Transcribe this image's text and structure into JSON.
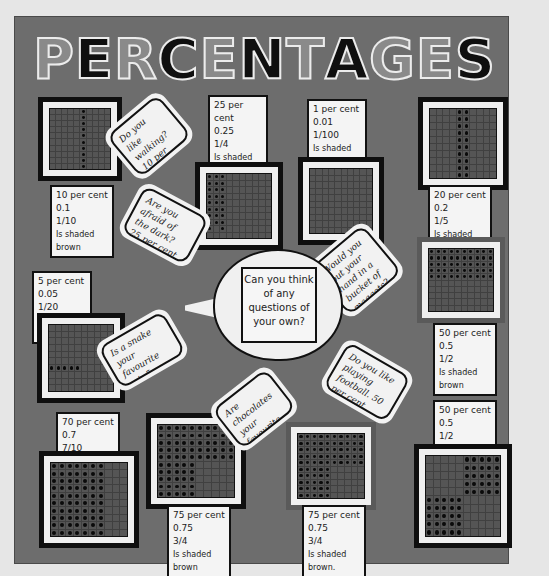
{
  "display": {
    "type": "classroom wall display board",
    "colors": {
      "background": "#e6e6e6",
      "board": "#6d6d6d",
      "letter_gray": "#8a8a8a",
      "letter_black": "#0f0f0f",
      "card": "#f4f4f4",
      "border": "#111111"
    },
    "title": {
      "text": "PERCENTAGES",
      "letters": [
        {
          "char": "P",
          "tone": "gray"
        },
        {
          "char": "E",
          "tone": "black"
        },
        {
          "char": "R",
          "tone": "gray"
        },
        {
          "char": "C",
          "tone": "black"
        },
        {
          "char": "E",
          "tone": "gray"
        },
        {
          "char": "N",
          "tone": "black"
        },
        {
          "char": "T",
          "tone": "gray"
        },
        {
          "char": "A",
          "tone": "black"
        },
        {
          "char": "G",
          "tone": "gray"
        },
        {
          "char": "E",
          "tone": "gray"
        },
        {
          "char": "S",
          "tone": "black"
        }
      ]
    },
    "grids": [
      {
        "id": "g10",
        "lines": [
          "10 per cent",
          "0.1",
          "1/10",
          "Is shaded brown"
        ],
        "shaded_percent": 10
      },
      {
        "id": "g25",
        "lines": [
          "25 per cent",
          "0.25",
          "1/4",
          "Is shaded brown"
        ],
        "shaded_percent": 25
      },
      {
        "id": "g1",
        "lines": [
          "1 per cent",
          "0.01",
          "1/100",
          "Is shaded brown"
        ],
        "shaded_percent": 1
      },
      {
        "id": "g20",
        "lines": [
          "20 per cent",
          "0.2",
          "1/5",
          "Is shaded brown"
        ],
        "shaded_percent": 20
      },
      {
        "id": "g5",
        "lines": [
          "5 per cent",
          "0.05",
          "1/20",
          "Is shaded brown"
        ],
        "shaded_percent": 5
      },
      {
        "id": "g50a",
        "lines": [
          "50 per cent",
          "0.5",
          "1/2",
          "Is shaded brown"
        ],
        "shaded_percent": 50
      },
      {
        "id": "g70",
        "lines": [
          "70 per cent",
          "0.7",
          "7/10",
          "Is shaded brown"
        ],
        "shaded_percent": 70
      },
      {
        "id": "g75a",
        "lines": [
          "75 per cent",
          "0.75",
          "3/4",
          "Is shaded brown"
        ],
        "shaded_percent": 75
      },
      {
        "id": "g75b",
        "lines": [
          "75 per cent",
          "0.75",
          "3/4",
          "Is shaded brown."
        ],
        "shaded_percent": 75
      },
      {
        "id": "g50b",
        "lines": [
          "50 per cent",
          "0.5",
          "1/2",
          "Is shaded brown"
        ],
        "shaded_percent": 50
      }
    ],
    "questions": [
      "Do you like walking? 10 per cent said yes.",
      "Are you afraid of the dark? 25 per cent said yes.",
      "Would you put your hand in a bucket of maggots? 1 per cent said yes.",
      "Is a snake your favourite pet. 5 per cent said yes.",
      "Are chocolates your favourite sweets. 75 per cent said yes.",
      "Do you like playing football. 50 per cent said yes."
    ],
    "speech_bubble": {
      "text": "Can you think of any questions of your own?"
    }
  }
}
